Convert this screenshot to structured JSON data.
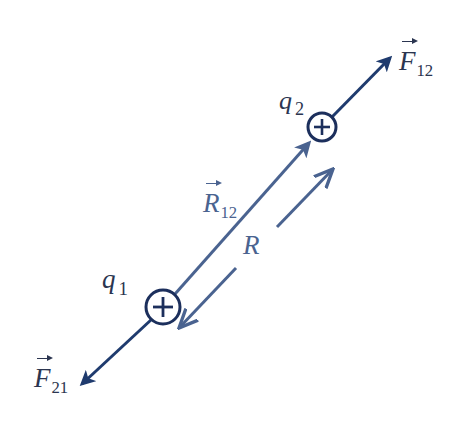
{
  "figure": {
    "type": "coulomb-force-diagram",
    "colors": {
      "charge": "#1c2f5c",
      "force_arrow": "#1f3b6e",
      "displacement_arrow": "#4a6390",
      "label_text": "#2b3550"
    },
    "charges": [
      {
        "id": "q1",
        "symbol": "q",
        "subscript": "1",
        "sign": "+",
        "sign_glyph": "plus-icon"
      },
      {
        "id": "q2",
        "symbol": "q",
        "subscript": "2",
        "sign": "+",
        "sign_glyph": "plus-icon"
      }
    ],
    "vectors": {
      "F12": {
        "symbol": "F",
        "subscript": "12",
        "description": "force on q2 from q1, pointing away from q1"
      },
      "F21": {
        "symbol": "F",
        "subscript": "21",
        "description": "force on q1 from q2, pointing away from q2"
      },
      "R12": {
        "symbol": "R",
        "subscript": "12",
        "description": "displacement vector from q1 to q2"
      }
    },
    "distance": {
      "symbol": "R",
      "description": "separation between charges (double-headed dimension arrow)"
    }
  }
}
